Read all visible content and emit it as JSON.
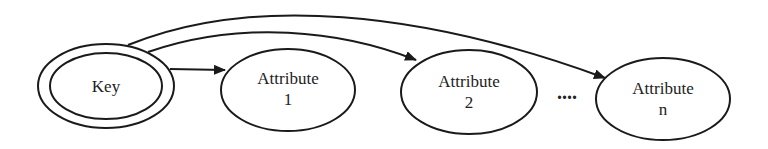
{
  "diagram": {
    "type": "key-attribute dependency diagram",
    "nodes": [
      {
        "id": "key",
        "label": "Key",
        "shape": "double-ellipse"
      },
      {
        "id": "attr1",
        "line1": "Attribute",
        "line2": "1",
        "shape": "ellipse"
      },
      {
        "id": "attr2",
        "line1": "Attribute",
        "line2": "2",
        "shape": "ellipse"
      },
      {
        "id": "attrn",
        "line1": "Attribute",
        "line2": "n",
        "shape": "ellipse"
      }
    ],
    "ellipsis": "....",
    "edges": [
      {
        "from": "key",
        "to": "attr1"
      },
      {
        "from": "key",
        "to": "attr2"
      },
      {
        "from": "key",
        "to": "attrn"
      }
    ]
  }
}
